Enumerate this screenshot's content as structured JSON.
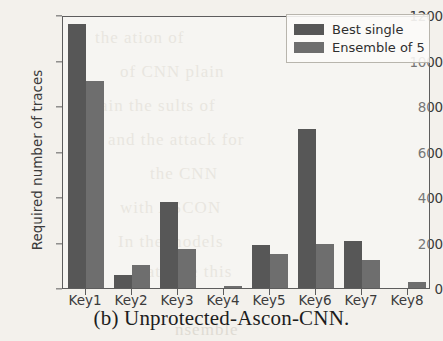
{
  "caption": "(b) Unprotected-Ascon-CNN.",
  "colors": {
    "best_single": "#575757",
    "ensemble_of_5": "#6e6e6e",
    "axis": "#5d5d5d",
    "text": "#3b3b3b",
    "page_background": "#f3f1ec"
  },
  "legend": {
    "position": "upper right",
    "entries": [
      {
        "label": "Best single",
        "color": "#575757"
      },
      {
        "label": "Ensemble of 5",
        "color": "#6e6e6e"
      }
    ]
  },
  "bleed_through_text": [
    "the ation of",
    "of CNN plain",
    "ain the sults of",
    "and the attack for",
    "the  CNN",
    "with  ASCON",
    "In the  models",
    "rate  the  this",
    "nsemble"
  ],
  "chart_data": {
    "type": "bar",
    "title": "",
    "xlabel": "",
    "ylabel": "Required number of traces",
    "categories": [
      "Key1",
      "Key2",
      "Key3",
      "Key4",
      "Key5",
      "Key6",
      "Key7",
      "Key8"
    ],
    "series": [
      {
        "name": "Best single",
        "color": "#575757",
        "values": [
          1160,
          58,
          378,
          0,
          190,
          700,
          205,
          0
        ]
      },
      {
        "name": "Ensemble of 5",
        "color": "#6e6e6e",
        "values": [
          910,
          100,
          170,
          8,
          150,
          192,
          125,
          28
        ]
      }
    ],
    "ylim": [
      0,
      1200
    ],
    "yticks": [
      0,
      200,
      400,
      600,
      800,
      1000,
      1200
    ],
    "ytick_labels": [
      "0",
      "200",
      "400",
      "600",
      "800",
      "1000",
      "1200"
    ],
    "grid": false,
    "legend_position": "upper right"
  }
}
